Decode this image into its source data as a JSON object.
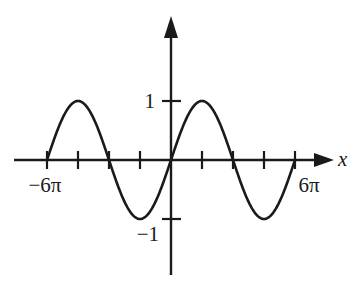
{
  "chart_data": {
    "type": "line",
    "title": "",
    "function": "y = sin(x/3)",
    "xlabel": "x",
    "ylabel": "",
    "xlim_pi": [
      -6,
      6
    ],
    "ylim": [
      -1,
      1
    ],
    "x_ticks_pi": [
      -6,
      -4.5,
      -3,
      -1.5,
      0,
      1.5,
      3,
      4.5,
      6
    ],
    "y_ticks": [
      1,
      -1
    ],
    "x_tick_labels": [
      {
        "value_pi": -6,
        "label": "−6π"
      },
      {
        "value_pi": 6,
        "label": "6π"
      }
    ],
    "y_tick_labels": [
      {
        "value": 1,
        "label": "1"
      },
      {
        "value": -1,
        "label": "−1"
      }
    ],
    "series": [
      {
        "name": "sin(x/3)",
        "x_range_pi": [
          -6,
          6
        ],
        "color": "#1a1a1a"
      }
    ],
    "grid": false,
    "legend": "none",
    "colors": {
      "axis": "#1a1a1a",
      "curve": "#1a1a1a"
    }
  }
}
